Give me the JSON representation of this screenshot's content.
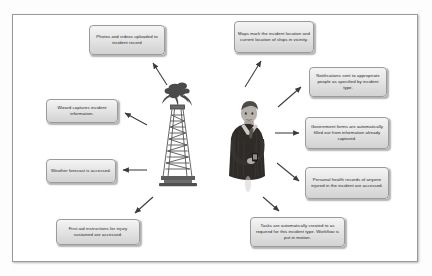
{
  "diagram": {
    "frame_border_color": "#9a9a9a",
    "node_fill_color": "#e2e2e2",
    "node_border_color": "#9b9b9b",
    "arrow_color": "#3b3b3b",
    "center_images": [
      {
        "name": "oil-rig-derrick-image",
        "alt": "Oil rig derrick with flare"
      },
      {
        "name": "businessman-with-device-image",
        "alt": "Man in dark suit holding a mobile device"
      }
    ],
    "nodes": [
      {
        "id": "photos",
        "text": "Photos and videos uploaded to incident record"
      },
      {
        "id": "maps",
        "text": "Maps mark the incident location and current location of ships in vicinity."
      },
      {
        "id": "wizard",
        "text": "Wizard captures incident information."
      },
      {
        "id": "notifications",
        "text": "Notifications sent to appropriate people as specified by incident type."
      },
      {
        "id": "forms",
        "text": "Government forms are automatically filled out from information already captured."
      },
      {
        "id": "weather",
        "text": "Weather forecast is accessed."
      },
      {
        "id": "health",
        "text": "Personal health records of anyone injured in the incident are accessed."
      },
      {
        "id": "firstaid",
        "text": "First aid instructions for injury sustained are accessed."
      },
      {
        "id": "tasks",
        "text": "Tasks are automatically created to as required for this incident type. Workflow is put in motion."
      }
    ],
    "arrows": [
      {
        "id": "arrow-to-photos",
        "direction": "up-left"
      },
      {
        "id": "arrow-to-wizard",
        "direction": "left-up"
      },
      {
        "id": "arrow-to-weather",
        "direction": "left"
      },
      {
        "id": "arrow-to-firstaid",
        "direction": "down-left"
      },
      {
        "id": "arrow-to-maps",
        "direction": "up-right"
      },
      {
        "id": "arrow-to-notifications",
        "direction": "up-right"
      },
      {
        "id": "arrow-to-forms",
        "direction": "right"
      },
      {
        "id": "arrow-to-health",
        "direction": "down-right"
      },
      {
        "id": "arrow-to-tasks",
        "direction": "down"
      }
    ]
  }
}
